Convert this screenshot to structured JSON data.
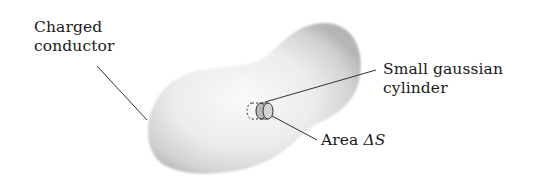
{
  "figure": {
    "labels": {
      "conductor_line1": "Charged",
      "conductor_line2": "conductor",
      "cylinder_line1": "Small gaussian",
      "cylinder_line2": "cylinder",
      "area_prefix": "Area ",
      "area_symbol": "ΔS"
    },
    "colors": {
      "background": "#ffffff",
      "conductor_fill_center": "#f7f7f7",
      "conductor_fill_edge": "#b8b8b8",
      "leader_line": "#333333",
      "cylinder_fill": "#c8c8c8",
      "text": "#1a1a1a"
    }
  }
}
